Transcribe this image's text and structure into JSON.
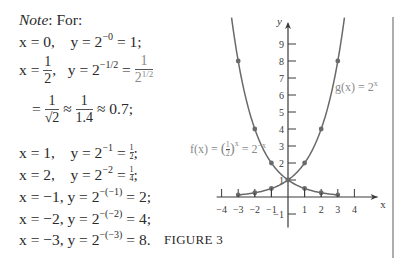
{
  "note": {
    "heading_italic": "Note",
    "heading_rest": ": For:",
    "lines": [
      {
        "x": "x = 0,",
        "y": "y = 2",
        "exp": "−0",
        "rest": " = 1;"
      },
      {
        "x_pre": "x = ",
        "x_num": "1",
        "x_den": "2",
        "x_post": ",",
        "y": "y = 2",
        "exp": "−1/2",
        "eq": " = ",
        "f_num": "1",
        "f_den_base": "2",
        "f_den_exp": "1/2"
      },
      {
        "pre": "= ",
        "a_num": "1",
        "a_den": "√2",
        "approx1": " ≈ ",
        "b_num": "1",
        "b_den": "1.4",
        "approx2": " ≈ 0.7;"
      },
      {
        "x": "x = 1,",
        "y": "y = 2",
        "exp": "−1",
        "eq": " = ",
        "f_num": "1",
        "f_den": "2",
        "end": ";"
      },
      {
        "x": "x = 2,",
        "y": "y = 2",
        "exp": "−2",
        "eq": " = ",
        "f_num": "1",
        "f_den": "4",
        "end": ";"
      },
      {
        "x": "x = −1,",
        "y": " y = 2",
        "exp": "−(−1)",
        "rest": " = 2;"
      },
      {
        "x": "x = −2,",
        "y": " y = 2",
        "exp": "−(−2)",
        "rest": " = 4;"
      },
      {
        "x": "x = −3,",
        "y": " y = 2",
        "exp": "−(−3)",
        "rest": " = 8."
      }
    ]
  },
  "caption": "FIGURE 3",
  "chart_data": {
    "type": "line",
    "title": "FIGURE 3",
    "xlabel": "x",
    "ylabel": "y",
    "xlim": [
      -4.3,
      5.2
    ],
    "ylim": [
      -1.8,
      10.2
    ],
    "x_ticks": [
      -4,
      -3,
      -2,
      -1,
      1,
      2,
      3,
      4
    ],
    "y_ticks": [
      -1,
      1,
      2,
      3,
      4,
      5,
      6,
      7,
      8,
      9
    ],
    "grid": false,
    "series": [
      {
        "name": "g(x) = 2^x",
        "label_main": "g(x) = 2",
        "label_exp": "x",
        "points": [
          [
            -3,
            0.125
          ],
          [
            -2,
            0.25
          ],
          [
            -1,
            0.5
          ],
          [
            0,
            1
          ],
          [
            1,
            2
          ],
          [
            2,
            4
          ],
          [
            3,
            8
          ]
        ],
        "x_range": [
          -3,
          3.4
        ]
      },
      {
        "name": "f(x) = (1/2)^x = 2^-x",
        "label_main": "f(x) = ",
        "label_exp": "x",
        "label_tail": " = 2",
        "label_tail_exp": "−x",
        "points": [
          [
            -3,
            8
          ],
          [
            -2,
            4
          ],
          [
            -1,
            2
          ],
          [
            0,
            1
          ],
          [
            1,
            0.5
          ],
          [
            2,
            0.25
          ],
          [
            3,
            0.125
          ]
        ],
        "x_range": [
          -3.4,
          3
        ]
      }
    ],
    "colors": {
      "curve": "#6a6a6a",
      "axis": "#3a3a3a",
      "label": "#8a8a8a"
    }
  }
}
